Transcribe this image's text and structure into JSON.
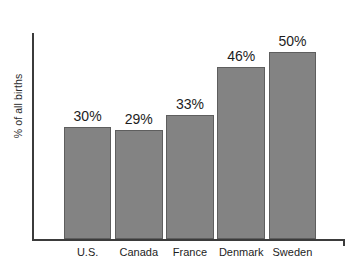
{
  "chart_data": {
    "type": "bar",
    "title": "",
    "subtitle": "",
    "xlabel": "",
    "ylabel": "% of all births",
    "categories": [
      "U.S.",
      "Canada",
      "France",
      "Denmark",
      "Sweden"
    ],
    "values": [
      30,
      29,
      33,
      46,
      50
    ],
    "value_labels": [
      "30%",
      "29%",
      "33%",
      "46%",
      "50%"
    ],
    "ylim": [
      0,
      55
    ],
    "grid": false,
    "legend": null,
    "annotations": [],
    "series": [
      {
        "name": "% of all births",
        "values": [
          30,
          29,
          33,
          46,
          50
        ]
      }
    ]
  },
  "style": {
    "bar_fill": "#838383",
    "bar_border": "#5e5e5e",
    "axis_color": "#3b3b3b",
    "text_color": "#1d1d1d",
    "background": "#ffffff"
  }
}
